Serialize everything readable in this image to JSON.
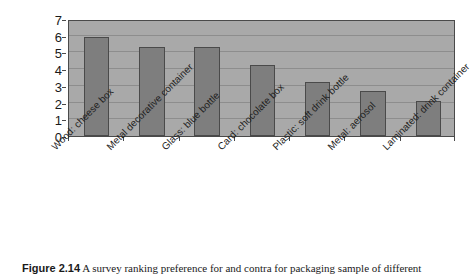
{
  "chart_data": {
    "type": "bar",
    "title": "",
    "xlabel": "",
    "ylabel": "",
    "categories": [
      "Wood: cheese box",
      "Metal decorative container",
      "Glass: blue bottle",
      "Card: chocolate box",
      "Plastic: soft drink bottle",
      "Metal: aerosol",
      "Laminated: drink container"
    ],
    "values": [
      5.95,
      5.35,
      5.3,
      4.25,
      3.25,
      2.7,
      2.1
    ],
    "ylim": [
      0,
      7
    ],
    "ytick_labels": [
      "0",
      "1",
      "2",
      "3",
      "4",
      "5",
      "6",
      "7"
    ],
    "ytick_values": [
      0,
      1,
      2,
      3,
      4,
      5,
      6,
      7
    ],
    "grid": true,
    "legend": "none",
    "bar_color": "#7e7e7e",
    "bar_border_color": "#4a4a4a",
    "plot_background": "#a9a9a9",
    "gridline_color": "#8d8d8d",
    "label_rotation_degrees": -45
  },
  "caption": {
    "figure_label": "Figure 2.14",
    "text": "A survey ranking preference for and contra for packaging sample of different"
  }
}
